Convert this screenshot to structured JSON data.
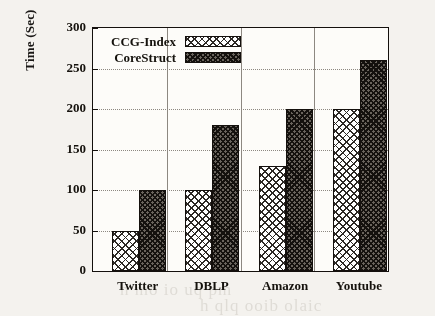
{
  "chart_data": {
    "type": "bar",
    "title": "",
    "xlabel": "",
    "ylabel": "Time (Sec)",
    "categories": [
      "Twitter",
      "DBLP",
      "Amazon",
      "Youtube"
    ],
    "series": [
      {
        "name": "CCG-Index",
        "values": [
          50,
          100,
          130,
          200
        ],
        "pattern": "light-crosshatch",
        "color": "#ffffff"
      },
      {
        "name": "CoreStruct",
        "values": [
          100,
          180,
          200,
          260
        ],
        "pattern": "dark-crosshatch",
        "color": "#6a655e"
      }
    ],
    "ylim": [
      0,
      300
    ],
    "yticks": [
      0,
      50,
      100,
      150,
      200,
      250,
      300
    ],
    "ytick_labels": [
      "0",
      "50",
      "100",
      "150",
      "200",
      "250",
      "300"
    ],
    "grid": "horizontal-dotted",
    "legend_position": "top-left-inside"
  },
  "axes": {
    "y_label": "Time (Sec)"
  },
  "legend": {
    "entries": [
      {
        "label": "CCG-Index"
      },
      {
        "label": "CoreStruct"
      }
    ]
  },
  "background_artifacts": {
    "lines": [
      "ruits",
      "ghtmore  tho  t",
      "n mo  io  uq  pm",
      "h  qlq  ooib  olaic"
    ]
  }
}
